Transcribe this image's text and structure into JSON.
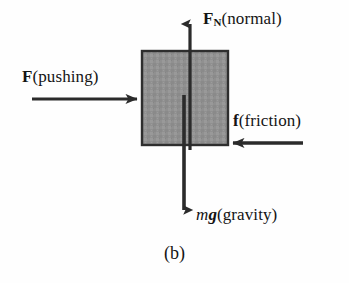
{
  "figure": {
    "caption": "(b)",
    "background_color": "#fefefe",
    "block": {
      "name": "block",
      "fill_color": "#909090",
      "border_color": "#2e2e2e",
      "x": 142,
      "y": 51,
      "width": 86,
      "height": 94
    },
    "forces": [
      {
        "id": "normal",
        "symbol": "F",
        "subscript": "N",
        "description": "(normal)",
        "direction": "up",
        "label_text": "F_N (normal)"
      },
      {
        "id": "pushing",
        "symbol": "F",
        "subscript": "",
        "description": "(pushing)",
        "direction": "right",
        "label_text": "F (pushing)"
      },
      {
        "id": "friction",
        "symbol": "f",
        "subscript": "",
        "description": "(friction)",
        "direction": "left",
        "label_text": "f (friction)"
      },
      {
        "id": "gravity",
        "symbol": "mg",
        "subscript": "",
        "description": "(gravity)",
        "direction": "down",
        "label_text": "mg (gravity)"
      }
    ],
    "labels": {
      "normal_symbol": "F",
      "normal_subscript": "N",
      "normal_description": "(normal)",
      "pushing_symbol": "F",
      "pushing_description": "(pushing)",
      "friction_symbol": "f",
      "friction_description": "(friction)",
      "gravity_symbol_m": "m",
      "gravity_symbol_g": "g",
      "gravity_description": "(gravity)"
    },
    "arrow_color": "#2b2b2b"
  }
}
